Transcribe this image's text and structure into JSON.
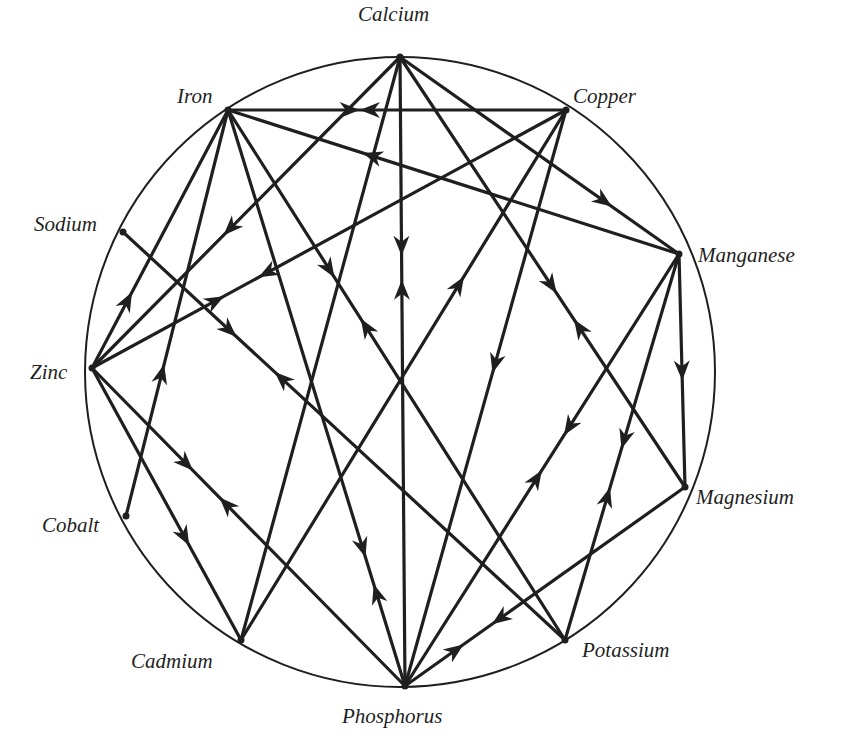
{
  "diagram": {
    "type": "circular-network",
    "circle": {
      "cx": 400,
      "cy": 372,
      "r": 315
    },
    "stroke_color": "#1f1f1f",
    "nodes": [
      {
        "id": "calcium",
        "label": "Calcium",
        "x": 400,
        "y": 57,
        "lx": 358,
        "ly": 4
      },
      {
        "id": "copper",
        "label": "Copper",
        "x": 566,
        "y": 110,
        "lx": 573,
        "ly": 86
      },
      {
        "id": "manganese",
        "label": "Manganese",
        "x": 679,
        "y": 254,
        "lx": 698,
        "ly": 245
      },
      {
        "id": "magnesium",
        "label": "Magnesium",
        "x": 685,
        "y": 487,
        "lx": 696,
        "ly": 487
      },
      {
        "id": "potassium",
        "label": "Potassium",
        "x": 565,
        "y": 640,
        "lx": 582,
        "ly": 640
      },
      {
        "id": "phosphorus",
        "label": "Phosphorus",
        "x": 405,
        "y": 686,
        "lx": 342,
        "ly": 706
      },
      {
        "id": "cadmium",
        "label": "Cadmium",
        "x": 241,
        "y": 640,
        "lx": 131,
        "ly": 651
      },
      {
        "id": "cobalt",
        "label": "Cobalt",
        "x": 126,
        "y": 516,
        "lx": 42,
        "ly": 515
      },
      {
        "id": "zinc",
        "label": "Zinc",
        "x": 92,
        "y": 368,
        "lx": 30,
        "ly": 362
      },
      {
        "id": "sodium",
        "label": "Sodium",
        "x": 123,
        "y": 232,
        "lx": 34,
        "ly": 214
      },
      {
        "id": "iron",
        "label": "Iron",
        "x": 228,
        "y": 110,
        "lx": 177,
        "ly": 86
      }
    ],
    "edges": [
      {
        "from": "iron",
        "to": "copper",
        "arrows": [
          {
            "t": 0.36,
            "dir": "fwd"
          },
          {
            "t": 0.42,
            "dir": "back"
          }
        ]
      },
      {
        "from": "calcium",
        "to": "zinc",
        "arrows": [
          {
            "t": 0.55,
            "dir": "fwd"
          }
        ]
      },
      {
        "from": "calcium",
        "to": "phosphorus",
        "arrows": [
          {
            "t": 0.3,
            "dir": "fwd"
          },
          {
            "t": 0.37,
            "dir": "back"
          }
        ]
      },
      {
        "from": "calcium",
        "to": "manganese",
        "arrows": [
          {
            "t": 0.73,
            "dir": "fwd"
          }
        ]
      },
      {
        "from": "calcium",
        "to": "magnesium",
        "arrows": [
          {
            "t": 0.53,
            "dir": "fwd"
          },
          {
            "t": 0.63,
            "dir": "back"
          }
        ]
      },
      {
        "from": "calcium",
        "to": "cadmium",
        "arrows": []
      },
      {
        "from": "manganese",
        "to": "iron",
        "arrows": [
          {
            "t": 0.68,
            "dir": "fwd"
          }
        ]
      },
      {
        "from": "iron",
        "to": "zinc",
        "arrows": [
          {
            "t": 0.74,
            "dir": "back"
          }
        ]
      },
      {
        "from": "iron",
        "to": "cobalt",
        "arrows": [
          {
            "t": 0.65,
            "dir": "back"
          }
        ]
      },
      {
        "from": "iron",
        "to": "phosphorus",
        "arrows": [
          {
            "t": 0.76,
            "dir": "fwd"
          },
          {
            "t": 0.84,
            "dir": "back"
          }
        ]
      },
      {
        "from": "iron",
        "to": "potassium",
        "arrows": [
          {
            "t": 0.3,
            "dir": "fwd"
          },
          {
            "t": 0.41,
            "dir": "back"
          }
        ]
      },
      {
        "from": "copper",
        "to": "zinc",
        "arrows": [
          {
            "t": 0.63,
            "dir": "fwd"
          },
          {
            "t": 0.74,
            "dir": "back"
          }
        ]
      },
      {
        "from": "copper",
        "to": "cadmium",
        "arrows": [
          {
            "t": 0.33,
            "dir": "back"
          }
        ]
      },
      {
        "from": "copper",
        "to": "phosphorus",
        "arrows": [
          {
            "t": 0.44,
            "dir": "fwd"
          }
        ]
      },
      {
        "from": "manganese",
        "to": "magnesium",
        "arrows": [
          {
            "t": 0.5,
            "dir": "fwd"
          }
        ]
      },
      {
        "from": "manganese",
        "to": "phosphorus",
        "arrows": [
          {
            "t": 0.4,
            "dir": "fwd"
          },
          {
            "t": 0.52,
            "dir": "back"
          }
        ]
      },
      {
        "from": "manganese",
        "to": "potassium",
        "arrows": [
          {
            "t": 0.48,
            "dir": "fwd"
          },
          {
            "t": 0.63,
            "dir": "back"
          }
        ]
      },
      {
        "from": "magnesium",
        "to": "phosphorus",
        "arrows": [
          {
            "t": 0.66,
            "dir": "fwd"
          },
          {
            "t": 0.82,
            "dir": "back"
          }
        ]
      },
      {
        "from": "sodium",
        "to": "potassium",
        "arrows": [
          {
            "t": 0.24,
            "dir": "fwd"
          },
          {
            "t": 0.36,
            "dir": "back"
          }
        ]
      },
      {
        "from": "zinc",
        "to": "phosphorus",
        "arrows": [
          {
            "t": 0.3,
            "dir": "fwd"
          },
          {
            "t": 0.43,
            "dir": "back"
          }
        ]
      },
      {
        "from": "zinc",
        "to": "cadmium",
        "arrows": [
          {
            "t": 0.62,
            "dir": "fwd"
          }
        ]
      }
    ]
  }
}
